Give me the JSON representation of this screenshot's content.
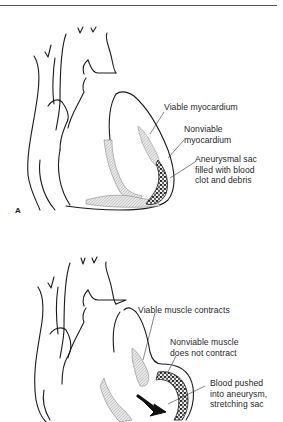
{
  "figure": {
    "panels": [
      {
        "id": "A",
        "letter": "A",
        "labels": [
          {
            "text": "Viable myocardium"
          },
          {
            "text": "Nonviable\nmyocardium"
          },
          {
            "text": "Aneurysmal sac\nfilled with blood\nclot and debris"
          }
        ]
      },
      {
        "id": "B",
        "letter": "",
        "labels": [
          {
            "text": "Viable muscle contracts"
          },
          {
            "text": "Nonviable muscle\ndoes not contract"
          },
          {
            "text": "Blood pushed\ninto aneurysm,\nstretching sac"
          }
        ]
      }
    ],
    "colors": {
      "line": "#1a1a1a",
      "shade": "#c8c8c8",
      "clot": "#222222"
    }
  }
}
